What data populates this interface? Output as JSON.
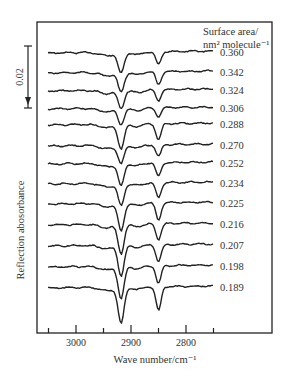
{
  "chart_data": {
    "type": "line",
    "title": "",
    "xlabel": "Wave number/cm⁻¹",
    "ylabel": "Reflection abosorbance",
    "legend_title_line1": "Surface area/",
    "legend_title_line2": "nm² molecule⁻¹",
    "xlim": [
      3070,
      2740
    ],
    "x_reversed": true,
    "x_ticks_major": [
      3000,
      2900,
      2800
    ],
    "x_ticks_minor": [
      3050,
      2950,
      2850,
      2750
    ],
    "x_tick_labels": [
      "3000",
      "2900",
      "2800"
    ],
    "scale_bar": {
      "label": "0.02",
      "value": 0.02
    },
    "grid": false,
    "peaks_cm": [
      2918,
      2850
    ],
    "series": [
      {
        "name": "0.360",
        "offset_y": 52,
        "peak1_depth": 21,
        "peak2_depth": 13
      },
      {
        "name": "0.342",
        "offset_y": 72,
        "peak1_depth": 20,
        "peak2_depth": 13
      },
      {
        "name": "0.324",
        "offset_y": 90,
        "peak1_depth": 18,
        "peak2_depth": 11
      },
      {
        "name": "0.306",
        "offset_y": 108,
        "peak1_depth": 16,
        "peak2_depth": 9
      },
      {
        "name": "0.288",
        "offset_y": 124,
        "peak1_depth": 24,
        "peak2_depth": 16
      },
      {
        "name": "0.270",
        "offset_y": 145,
        "peak1_depth": 18,
        "peak2_depth": 12
      },
      {
        "name": "0.252",
        "offset_y": 163,
        "peak1_depth": 22,
        "peak2_depth": 14
      },
      {
        "name": "0.234",
        "offset_y": 183,
        "peak1_depth": 22,
        "peak2_depth": 15
      },
      {
        "name": "0.225",
        "offset_y": 203,
        "peak1_depth": 27,
        "peak2_depth": 17
      },
      {
        "name": "0.216",
        "offset_y": 224,
        "peak1_depth": 29,
        "peak2_depth": 16
      },
      {
        "name": "0.207",
        "offset_y": 245,
        "peak1_depth": 30,
        "peak2_depth": 17
      },
      {
        "name": "0.198",
        "offset_y": 266,
        "peak1_depth": 32,
        "peak2_depth": 18
      },
      {
        "name": "0.189",
        "offset_y": 287,
        "peak1_depth": 36,
        "peak2_depth": 24
      }
    ]
  }
}
